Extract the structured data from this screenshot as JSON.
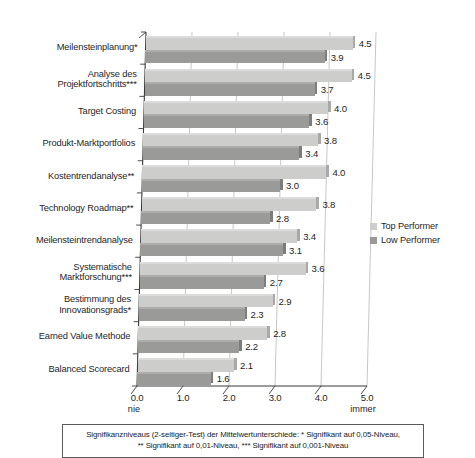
{
  "chart_data": {
    "type": "bar",
    "orientation": "horizontal",
    "title": "",
    "xlabel": "",
    "ylabel": "",
    "xlim": [
      0.0,
      5.0
    ],
    "xticks": [
      "0.0",
      "1.0",
      "2.0",
      "3.0",
      "4.0",
      "5.0"
    ],
    "grid": true,
    "legend_position": "right",
    "scale_anchor_low": "nie",
    "scale_anchor_high": "immer",
    "categories": [
      "Meilensteinplanung*",
      "Analyse des\nProjektfortschritts***",
      "Target Costing",
      "Produkt-Marktportfolios",
      "Kostentrendanalyse**",
      "Technology Roadmap**",
      "Meilensteintrendanalyse",
      "Systematische\nMarktforschung***",
      "Bestimmung des\nInnovationsgrads*",
      "Earned Value Methode",
      "Balanced Scorecard"
    ],
    "series": [
      {
        "name": "Top Performer",
        "color": "#cdcdcb",
        "values": [
          4.5,
          4.5,
          4.0,
          3.8,
          4.0,
          3.8,
          3.4,
          3.6,
          2.9,
          2.8,
          2.1
        ],
        "labels": [
          "4.5",
          "4.5",
          "4.0",
          "3.8",
          "4.0",
          "3.8",
          "3.4",
          "3.6",
          "2.9",
          "2.8",
          "2.1"
        ]
      },
      {
        "name": "Low Performer",
        "color": "#9a9a98",
        "values": [
          3.9,
          3.7,
          3.6,
          3.4,
          3.0,
          2.8,
          3.1,
          2.7,
          2.3,
          2.2,
          1.6
        ],
        "labels": [
          "3.9",
          "3.7",
          "3.6",
          "3.4",
          "3.0",
          "2.8",
          "3.1",
          "2.7",
          "2.3",
          "2.2",
          "1.6"
        ]
      }
    ]
  },
  "legend": {
    "items": [
      {
        "label": "Top Performer",
        "color": "#cdcdcb"
      },
      {
        "label": "Low Performer",
        "color": "#9a9a98"
      }
    ]
  },
  "footnote": {
    "line1": "Signifikanzniveaus (2-seitiger-Test) der Mittelwertunterschiede: * Signifikant auf 0,05-Niveau,",
    "line2": "** Signifikant auf 0,01-Niveau, *** Signifikant auf 0,001-Niveau"
  }
}
